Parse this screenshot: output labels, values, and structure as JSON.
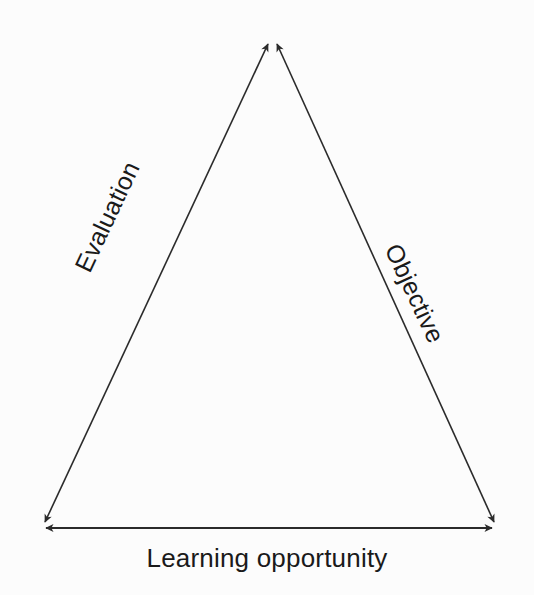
{
  "diagram": {
    "type": "triangle-relationship",
    "background_color": "#fcfcfc",
    "stroke_color": "#2b2b2b",
    "text_color": "#1a1a1a",
    "vertices": [
      {
        "name": "apex",
        "x": 272,
        "y": 36
      },
      {
        "name": "bottom-left",
        "x": 40,
        "y": 528
      },
      {
        "name": "bottom-right",
        "x": 499,
        "y": 528
      }
    ],
    "edges": [
      {
        "id": "left-edge",
        "label": "Evaluation",
        "from": "bottom-left",
        "to": "apex",
        "arrowheads": "both",
        "rotation_deg": -64.8
      },
      {
        "id": "right-edge",
        "label": "Objective",
        "from": "apex",
        "to": "bottom-right",
        "arrowheads": "both",
        "rotation_deg": 64.8
      },
      {
        "id": "bottom-edge",
        "label": "Learning opportunity",
        "from": "bottom-left",
        "to": "bottom-right",
        "arrowheads": "both",
        "rotation_deg": 0
      }
    ]
  }
}
